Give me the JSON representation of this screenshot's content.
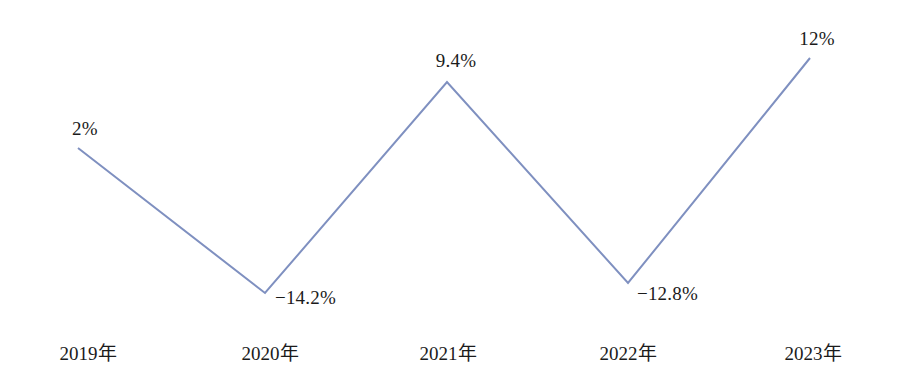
{
  "chart_data": {
    "type": "line",
    "title": "",
    "xlabel": "",
    "ylabel": "",
    "grid": false,
    "legend": "none",
    "categories": [
      "2019年",
      "2020年",
      "2021年",
      "2022年",
      "2023年"
    ],
    "values": [
      2,
      -14.2,
      9.4,
      -12.8,
      12
    ],
    "value_labels": [
      "2%",
      "−14.2%",
      "9.4%",
      "−12.8%",
      "12%"
    ],
    "ylim": [
      -16.5,
      13.5
    ],
    "series": [
      {
        "name": "",
        "values": [
          2,
          -14.2,
          9.4,
          -12.8,
          12
        ]
      }
    ],
    "line_color": "#7f90c0",
    "line_width": 2,
    "markers": false,
    "background": "#ffffff",
    "text_color": "#1b1b1b"
  },
  "axis": {
    "ticks": [
      {
        "label": "2019年",
        "x": 88
      },
      {
        "label": "2020年",
        "x": 270
      },
      {
        "label": "2021年",
        "x": 448
      },
      {
        "label": "2022年",
        "x": 628
      },
      {
        "label": "2023年",
        "x": 813
      }
    ]
  },
  "points": [
    {
      "label": "2%",
      "px": 78,
      "py": 148,
      "lx": 72,
      "ly": 119,
      "align": "left"
    },
    {
      "label": "−14.2%",
      "px": 265,
      "py": 293,
      "lx": 275,
      "ly": 288,
      "align": "left"
    },
    {
      "label": "9.4%",
      "px": 447,
      "py": 82,
      "lx": 456,
      "ly": 51,
      "align": "center"
    },
    {
      "label": "−12.8%",
      "px": 628,
      "py": 283,
      "lx": 637,
      "ly": 284,
      "align": "left"
    },
    {
      "label": "12%",
      "px": 810,
      "py": 58,
      "lx": 817,
      "ly": 29,
      "align": "center"
    }
  ],
  "polyline": "78,148 265,293 447,82 628,283 810,58"
}
